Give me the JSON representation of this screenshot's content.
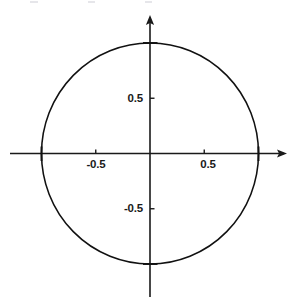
{
  "figure": {
    "name": "unit-circle-plot",
    "background_color": "#ffffff",
    "line_color": "#111111",
    "axis_color": "#1a1a1a",
    "width": 299,
    "height": 307
  },
  "axes": {
    "origin": {
      "x": 150,
      "y": 153.5
    },
    "x_axis": {
      "start_x": 10,
      "end_x": 287,
      "arrow": "right-arrow"
    },
    "y_axis": {
      "start_y": 15,
      "end_y": 297,
      "arrow": "up-arrow"
    },
    "px_per_unit_x": 108.5,
    "px_per_unit_y": 110.5
  },
  "ticks": {
    "x": [
      {
        "value": -0.5,
        "label": "-0.5",
        "px": 95.75,
        "label_x": 96,
        "label_y": 159
      },
      {
        "value": 0.5,
        "label": "0.5",
        "px": 204.25,
        "label_x": 208,
        "label_y": 159
      }
    ],
    "y": [
      {
        "value": 0.5,
        "label": "0.5",
        "px": 98.25,
        "label_x": 143,
        "label_y": 93
      },
      {
        "value": -0.5,
        "label": "-0.5",
        "px": 208.75,
        "label_x": 143,
        "label_y": 203
      }
    ],
    "circle_intersections": [
      {
        "label": "",
        "x": 41.5,
        "y": 153.5
      },
      {
        "label": "",
        "x": 258.5,
        "y": 153.5
      },
      {
        "label": "",
        "x": 150,
        "y": 43
      },
      {
        "label": "",
        "x": 150,
        "y": 264
      }
    ]
  },
  "chart_data": {
    "type": "line",
    "title": "",
    "subtitle": "",
    "xlabel": "",
    "ylabel": "",
    "xlim": [
      -1.29,
      1.26
    ],
    "ylim": [
      -1.3,
      1.25
    ],
    "xticks": [
      -0.5,
      0.5
    ],
    "xticklabels": [
      "-0.5",
      "0.5"
    ],
    "yticks": [
      -0.5,
      0.5
    ],
    "yticklabels": [
      "-0.5",
      "0.5"
    ],
    "grid": false,
    "legend": null,
    "axis_style": "cartesian-arrows-through-origin",
    "series": [
      {
        "name": "unit circle",
        "equation": "x^2 + y^2 = 1",
        "shape": "circle",
        "center": [
          0,
          0
        ],
        "radius": 1,
        "closed": true,
        "color": "#111111",
        "linewidth": 1.5,
        "points": [
          [
            1.0,
            0.0
          ],
          [
            0.966,
            0.259
          ],
          [
            0.866,
            0.5
          ],
          [
            0.707,
            0.707
          ],
          [
            0.5,
            0.866
          ],
          [
            0.259,
            0.966
          ],
          [
            0.0,
            1.0
          ],
          [
            -0.259,
            0.966
          ],
          [
            -0.5,
            0.866
          ],
          [
            -0.707,
            0.707
          ],
          [
            -0.866,
            0.5
          ],
          [
            -0.966,
            0.259
          ],
          [
            -1.0,
            0.0
          ],
          [
            -0.966,
            -0.259
          ],
          [
            -0.866,
            -0.5
          ],
          [
            -0.707,
            -0.707
          ],
          [
            -0.5,
            -0.866
          ],
          [
            -0.259,
            -0.966
          ],
          [
            0.0,
            -1.0
          ],
          [
            0.259,
            -0.966
          ],
          [
            0.5,
            -0.866
          ],
          [
            0.707,
            -0.707
          ],
          [
            0.866,
            -0.5
          ],
          [
            0.966,
            -0.259
          ],
          [
            1.0,
            0.0
          ]
        ]
      }
    ],
    "annotations": []
  },
  "artifacts": {
    "top_specks": [
      {
        "x": 30,
        "y": 1,
        "width": 8
      },
      {
        "x": 88,
        "y": 1,
        "width": 7
      },
      {
        "x": 145,
        "y": 1,
        "width": 7
      }
    ]
  }
}
